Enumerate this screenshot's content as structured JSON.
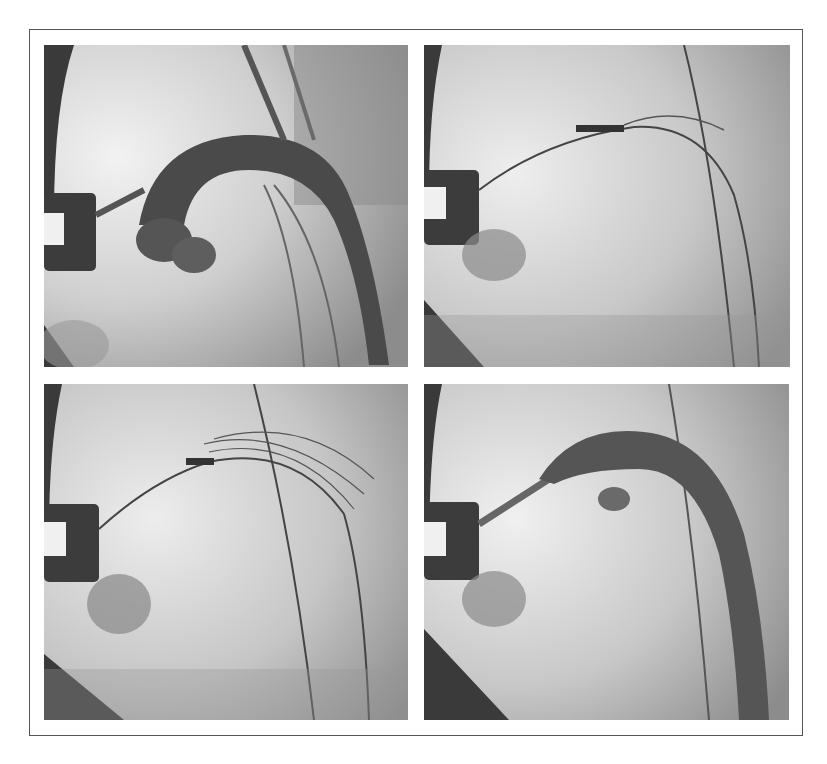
{
  "figure": {
    "layout": "2x2 grid",
    "panels": [
      {
        "position": "top-left",
        "description": "Contrast-filled aortic arch angiogram with catheter and radiopaque rectangular marker"
      },
      {
        "position": "top-right",
        "description": "Guidewires and balloon/stent catheter positioned across aortic arch, no contrast"
      },
      {
        "position": "bottom-left",
        "description": "Multiple wires and stent markers deployed across arch"
      },
      {
        "position": "bottom-right",
        "description": "Post-procedure angiogram showing contrast-filled arch with stent"
      }
    ],
    "colors": {
      "background": "#ffffff",
      "frame_border": "#555555",
      "tissue_light": "#e6e6e6",
      "tissue_mid": "#b5b5b5",
      "vessel_dark": "#4a4a4a",
      "marker": "#3a3a3a"
    }
  }
}
